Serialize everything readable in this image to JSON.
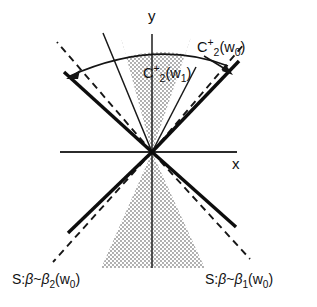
{
  "figure": {
    "background_color": "#ffffff",
    "ink_color": "#111111",
    "stipple_color": "#4a4a4a",
    "axes": {
      "x_label": "x",
      "y_label": "y",
      "origin": {
        "x": 152,
        "y": 152
      },
      "x_axis": {
        "x1": 60,
        "y1": 152,
        "x2": 237,
        "y2": 152
      },
      "y_axis": {
        "x1": 152,
        "y1": 34,
        "x2": 152,
        "y2": 268
      }
    },
    "labels": [
      {
        "name": "cone-label-w0",
        "text": "C2+(w0)",
        "parts": {
          "base": "C",
          "sub": "2",
          "sup": "+",
          "arg": "(w",
          "argsub": "0",
          "argend": ")"
        },
        "x": 197,
        "y": 46
      },
      {
        "name": "cone-label-w1",
        "text": "C2+(w1)",
        "parts": {
          "base": "C",
          "sub": "2",
          "sup": "+",
          "arg": "(w",
          "argsub": "1",
          "argend": ")"
        },
        "x": 143,
        "y": 72
      },
      {
        "name": "sector-label-beta2",
        "text": "S:B~B2(w0)",
        "parts": {
          "prefix": "S:",
          "beta": "β",
          "tilde": "~",
          "beta2": "β",
          "sub": "2",
          "arg": "(w",
          "argsub": "0",
          "argend": ")"
        },
        "x": 12,
        "y": 279
      },
      {
        "name": "sector-label-beta1",
        "text": "S:B~B1(w0)",
        "parts": {
          "prefix": "S:",
          "beta": "β",
          "tilde": "~",
          "beta1": "β",
          "sub": "1",
          "arg": "(w",
          "argsub": "0",
          "argend": ")"
        },
        "x": 213,
        "y": 279
      }
    ],
    "regions": {
      "upper_cone_shaded": {
        "name": "C2+(w1) upper stippled cone",
        "apex": {
          "x": 152,
          "y": 152
        },
        "left_edge_top": {
          "x": 120,
          "y": 55
        },
        "right_edge_top": {
          "x": 192,
          "y": 55
        },
        "half_angle_deg": 19
      },
      "lower_cone_shaded": {
        "name": "lower stippled cone",
        "apex": {
          "x": 152,
          "y": 152
        },
        "left_edge_bottom": {
          "x": 101,
          "y": 268
        },
        "right_edge_bottom": {
          "x": 205,
          "y": 268
        },
        "half_angle_deg": 24
      }
    },
    "lines": {
      "thick_solid_upper_left": {
        "x1": 152,
        "y1": 152,
        "x2": 64,
        "y2": 72
      },
      "thick_solid_upper_right": {
        "x1": 152,
        "y1": 152,
        "x2": 239,
        "y2": 61
      },
      "dashed_upper_left": {
        "x1": 152,
        "y1": 152,
        "x2": 57,
        "y2": 42
      },
      "dashed_upper_right": {
        "x1": 152,
        "y1": 152,
        "x2": 245,
        "y2": 43
      },
      "thin_upper_left": {
        "x1": 152,
        "y1": 152,
        "x2": 103,
        "y2": 33
      },
      "thin_upper_right": {
        "x1": 152,
        "y1": 152,
        "x2": 196,
        "y2": 67
      },
      "thick_solid_lower_left": {
        "x1": 152,
        "y1": 152,
        "x2": 68,
        "y2": 233
      },
      "thick_solid_lower_right": {
        "x1": 152,
        "y1": 152,
        "x2": 236,
        "y2": 227
      },
      "dashed_lower_left": {
        "x1": 152,
        "y1": 152,
        "x2": 53,
        "y2": 262
      },
      "dashed_lower_right": {
        "x1": 152,
        "y1": 152,
        "x2": 250,
        "y2": 259
      }
    },
    "arc": {
      "name": "angle-arc",
      "from": {
        "x": 68,
        "y": 74
      },
      "apex_of_bulge": {
        "x": 155,
        "y": 49
      },
      "to": {
        "x": 232,
        "y": 70
      },
      "arrow_left": true,
      "arrow_right": true
    }
  }
}
